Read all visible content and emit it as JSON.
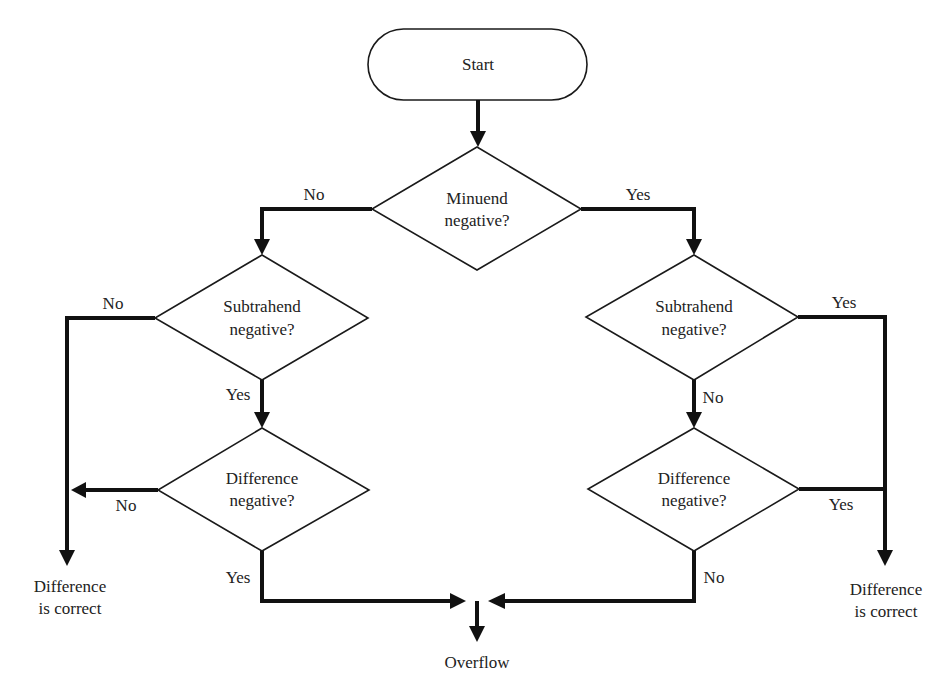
{
  "diagram": {
    "type": "flowchart",
    "colors": {
      "stroke": "#111111",
      "shape_fill": "#ffffff",
      "text": "#222222",
      "background": "#ffffff"
    },
    "nodes": {
      "start": {
        "kind": "terminal",
        "label": "Start"
      },
      "minuend": {
        "kind": "decision",
        "line1": "Minuend",
        "line2": "negative?"
      },
      "left_subtrahend": {
        "kind": "decision",
        "line1": "Subtrahend",
        "line2": "negative?"
      },
      "left_difference": {
        "kind": "decision",
        "line1": "Difference",
        "line2": "negative?"
      },
      "right_subtrahend": {
        "kind": "decision",
        "line1": "Subtrahend",
        "line2": "negative?"
      },
      "right_difference": {
        "kind": "decision",
        "line1": "Difference",
        "line2": "negative?"
      },
      "left_result": {
        "kind": "output",
        "line1": "Difference",
        "line2": "is correct"
      },
      "right_result": {
        "kind": "output",
        "line1": "Difference",
        "line2": "is correct"
      },
      "overflow": {
        "kind": "output",
        "label": "Overflow"
      }
    },
    "edge_labels": {
      "minuend_no": "No",
      "minuend_yes": "Yes",
      "left_subtrahend_no": "No",
      "left_subtrahend_yes": "Yes",
      "left_difference_no": "No",
      "left_difference_yes": "Yes",
      "right_subtrahend_yes": "Yes",
      "right_subtrahend_no": "No",
      "right_difference_yes": "Yes",
      "right_difference_no": "No"
    },
    "edges": [
      {
        "from": "start",
        "to": "minuend",
        "label": ""
      },
      {
        "from": "minuend",
        "to": "left_subtrahend",
        "label": "No"
      },
      {
        "from": "minuend",
        "to": "right_subtrahend",
        "label": "Yes"
      },
      {
        "from": "left_subtrahend",
        "to": "left_result",
        "label": "No"
      },
      {
        "from": "left_subtrahend",
        "to": "left_difference",
        "label": "Yes"
      },
      {
        "from": "left_difference",
        "to": "left_result",
        "label": "No"
      },
      {
        "from": "left_difference",
        "to": "overflow",
        "label": "Yes"
      },
      {
        "from": "right_subtrahend",
        "to": "right_result",
        "label": "Yes"
      },
      {
        "from": "right_subtrahend",
        "to": "right_difference",
        "label": "No"
      },
      {
        "from": "right_difference",
        "to": "right_result",
        "label": "Yes"
      },
      {
        "from": "right_difference",
        "to": "overflow",
        "label": "No"
      }
    ]
  }
}
